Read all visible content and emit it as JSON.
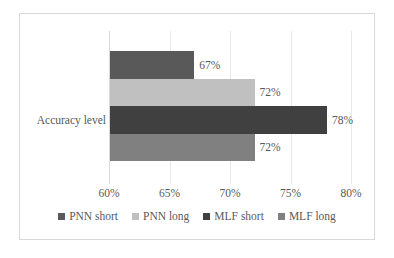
{
  "chart_data": {
    "type": "bar",
    "orientation": "horizontal",
    "title": "",
    "xlabel": "",
    "ylabel": "",
    "categories": [
      "Accuracy level"
    ],
    "xlim": [
      60,
      80
    ],
    "xticks": [
      "60%",
      "65%",
      "70%",
      "75%",
      "80%"
    ],
    "xtick_values": [
      60,
      65,
      70,
      75,
      80
    ],
    "grid": true,
    "legend_position": "bottom",
    "series": [
      {
        "name": "PNN short",
        "values": [
          67
        ],
        "label": "67%",
        "color": "#595959"
      },
      {
        "name": "PNN long",
        "values": [
          72
        ],
        "label": "72%",
        "color": "#c0c0c0"
      },
      {
        "name": "MLF short",
        "values": [
          78
        ],
        "label": "78%",
        "color": "#404040"
      },
      {
        "name": "MLF long",
        "values": [
          72
        ],
        "label": "72%",
        "color": "#808080"
      }
    ]
  },
  "axis": {
    "category_label": "Accuracy level"
  },
  "legend": {
    "items": [
      {
        "label": "PNN short",
        "color": "#595959"
      },
      {
        "label": "PNN long",
        "color": "#c0c0c0"
      },
      {
        "label": "MLF short",
        "color": "#404040"
      },
      {
        "label": "MLF long",
        "color": "#808080"
      }
    ]
  },
  "colors": {
    "border": "#d9d9d9",
    "gridline": "#e8e8e8",
    "text": "#595959",
    "background": "#ffffff"
  }
}
